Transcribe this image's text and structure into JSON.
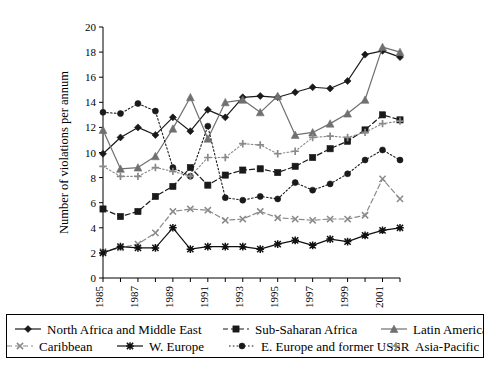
{
  "chart_data": {
    "type": "line",
    "title": "",
    "xlabel": "",
    "ylabel": "Number of violations per annum",
    "ylim": [
      0,
      20
    ],
    "ytick_step": 2,
    "yticks": [
      "0",
      "2",
      "4",
      "6",
      "8",
      "10",
      "12",
      "14",
      "16",
      "18",
      "20"
    ],
    "grid": false,
    "legend_position": "bottom",
    "x": [
      1985,
      1986,
      1987,
      1988,
      1989,
      1990,
      1991,
      1992,
      1993,
      1994,
      1995,
      1996,
      1997,
      1998,
      1999,
      2000,
      2001,
      2002
    ],
    "xtick_labels": [
      "1985",
      "1987",
      "1989",
      "1991",
      "1993",
      "1995",
      "1997",
      "1999",
      "2001"
    ],
    "xtick_values": [
      1985,
      1987,
      1989,
      1991,
      1993,
      1995,
      1997,
      1999,
      2001
    ],
    "series": [
      {
        "name": "North Africa and Middle East",
        "marker": "diamond",
        "dash": "solid",
        "color": "#1a1a1a",
        "values": [
          9.9,
          11.2,
          12.0,
          11.4,
          12.8,
          11.7,
          13.4,
          12.8,
          14.4,
          14.5,
          14.4,
          14.8,
          15.2,
          15.1,
          15.7,
          17.8,
          18.1,
          17.6
        ]
      },
      {
        "name": "Sub-Saharan Africa",
        "marker": "square",
        "dash": "dashed",
        "color": "#1a1a1a",
        "values": [
          5.5,
          4.9,
          5.3,
          6.5,
          7.3,
          8.8,
          7.4,
          8.2,
          8.6,
          8.7,
          8.4,
          8.9,
          9.6,
          10.3,
          10.9,
          11.8,
          13.0,
          12.6
        ]
      },
      {
        "name": "Latin America",
        "marker": "triangle",
        "dash": "solid",
        "color": "#707070",
        "values": [
          11.8,
          8.7,
          8.8,
          9.7,
          11.9,
          14.4,
          11.1,
          14.0,
          14.2,
          13.2,
          14.5,
          11.4,
          11.6,
          12.3,
          13.1,
          14.2,
          18.4,
          18.0
        ]
      },
      {
        "name": "Caribbean",
        "marker": "x",
        "dash": "dashed",
        "color": "#8a8a8a",
        "values": [
          2.1,
          2.4,
          2.7,
          3.6,
          5.3,
          5.5,
          5.4,
          4.6,
          4.7,
          5.3,
          4.8,
          4.7,
          4.6,
          4.7,
          4.7,
          5.0,
          7.9,
          6.3
        ]
      },
      {
        "name": "W. Europe",
        "marker": "star",
        "dash": "solid",
        "color": "#111111",
        "values": [
          2.0,
          2.5,
          2.4,
          2.4,
          4.0,
          2.3,
          2.5,
          2.5,
          2.5,
          2.3,
          2.7,
          3.0,
          2.6,
          3.1,
          2.9,
          3.4,
          3.8,
          4.0
        ]
      },
      {
        "name": "E. Europe and former USSR",
        "marker": "circle",
        "dash": "dotted",
        "color": "#1a1a1a",
        "values": [
          13.2,
          13.1,
          13.9,
          13.3,
          8.8,
          8.1,
          12.1,
          6.4,
          6.2,
          6.5,
          6.3,
          7.6,
          7.0,
          7.5,
          8.3,
          9.4,
          10.2,
          9.4
        ]
      },
      {
        "name": "Asia-Pacific",
        "marker": "plus",
        "dash": "dotted",
        "color": "#8a8a8a",
        "values": [
          8.9,
          8.1,
          8.1,
          8.8,
          8.5,
          8.1,
          9.6,
          9.6,
          10.7,
          10.6,
          9.9,
          10.1,
          11.2,
          11.3,
          11.2,
          11.6,
          12.3,
          12.5
        ]
      }
    ]
  },
  "legend": {
    "items": [
      {
        "label": "North Africa and Middle East",
        "marker": "diamond",
        "dash": "solid",
        "color": "#1a1a1a"
      },
      {
        "label": "Sub-Saharan Africa",
        "marker": "square",
        "dash": "dashed",
        "color": "#1a1a1a"
      },
      {
        "label": "Latin America",
        "marker": "triangle",
        "dash": "solid",
        "color": "#707070"
      },
      {
        "label": "Caribbean",
        "marker": "x",
        "dash": "dashed",
        "color": "#8a8a8a"
      },
      {
        "label": "W. Europe",
        "marker": "star",
        "dash": "solid",
        "color": "#111111"
      },
      {
        "label": "E. Europe and former USSR",
        "marker": "circle",
        "dash": "dotted",
        "color": "#1a1a1a"
      },
      {
        "label": "Asia-Pacific",
        "marker": "plus",
        "dash": "dotted",
        "color": "#8a8a8a"
      }
    ]
  }
}
